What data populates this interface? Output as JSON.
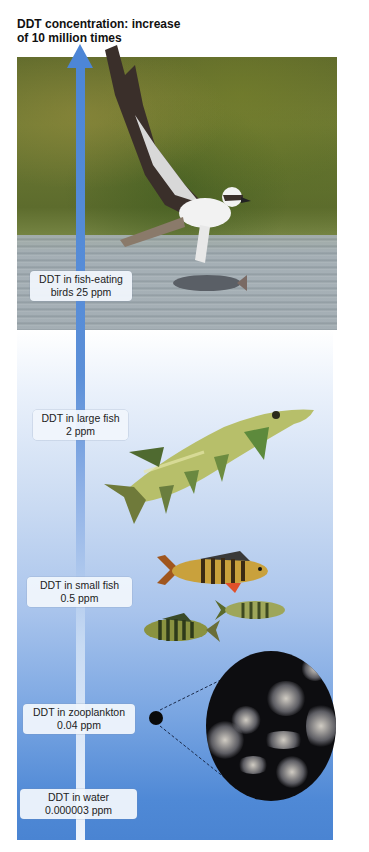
{
  "title": {
    "line1": "DDT concentration: increase",
    "line2": "of 10 million times"
  },
  "arrow": {
    "direction": "up",
    "color_top": "#4d86d6",
    "color_bottom": "#eef4fc"
  },
  "levels": [
    {
      "id": "birds",
      "line1": "DDT in fish-eating",
      "line2": "birds 25 ppm",
      "organism": "osprey"
    },
    {
      "id": "large-fish",
      "line1": "DDT in large fish",
      "line2": "2 ppm",
      "organism": "pike"
    },
    {
      "id": "small-fish",
      "line1": "DDT in small fish",
      "line2": "0.5 ppm",
      "organism": "perch"
    },
    {
      "id": "zooplankton",
      "line1": "DDT in zooplankton",
      "line2": "0.04 ppm",
      "organism": "zooplankton"
    },
    {
      "id": "water",
      "line1": "DDT in water",
      "line2": "0.000003 ppm",
      "organism": "water"
    }
  ],
  "colors": {
    "panel_top": "#ffffff",
    "panel_bottom": "#4a84d2",
    "label_bg": "#f0f5fc",
    "title_text": "#111111"
  }
}
